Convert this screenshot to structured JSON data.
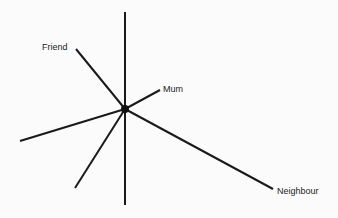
{
  "diagram": {
    "type": "network-star",
    "center": {
      "x": 125,
      "y": 109,
      "label": ""
    },
    "spokes": [
      {
        "id": "up",
        "x": 125,
        "y": 12,
        "label": ""
      },
      {
        "id": "friend",
        "x": 76,
        "y": 49,
        "label": "Friend"
      },
      {
        "id": "mum",
        "x": 160,
        "y": 90,
        "label": "Mum"
      },
      {
        "id": "neighbour",
        "x": 273,
        "y": 189,
        "label": "Neighbour"
      },
      {
        "id": "down",
        "x": 125,
        "y": 205,
        "label": ""
      },
      {
        "id": "lower-left",
        "x": 75,
        "y": 188,
        "label": ""
      },
      {
        "id": "left",
        "x": 20,
        "y": 141,
        "label": ""
      }
    ],
    "labels": {
      "friend": "Friend",
      "mum": "Mum",
      "neighbour": "Neighbour"
    },
    "colors": {
      "line": "#1a1a1a",
      "background": "#fbfbfb"
    }
  }
}
